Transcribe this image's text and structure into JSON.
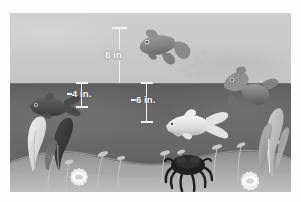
{
  "figure": {
    "kind": "aquarium-depth-diagram",
    "frame": {
      "x": 10,
      "y": 13,
      "width": 281,
      "height": 179
    },
    "background_color": "#ffffff"
  },
  "scene": {
    "air": {
      "label": "air-above-water",
      "color": "#c9c9c9",
      "top": 0,
      "height": 70
    },
    "water": {
      "label": "water",
      "color": "#656565",
      "top": 70,
      "height": 109
    },
    "waterline": {
      "label": "water-surface",
      "y": 70,
      "color": "#ebebeb"
    },
    "floor": {
      "label": "sand-bottom",
      "color": "#9a9a9a",
      "top": 128,
      "height": 51
    }
  },
  "measurements": [
    {
      "id": "height-above-water",
      "value": "8 in.",
      "number": 8,
      "unit": "in.",
      "orientation": "vertical",
      "from": "top-of-tank",
      "to": "water-surface",
      "x": 118,
      "top": 14,
      "length": 56,
      "label_offset": 26
    },
    {
      "id": "depth-left",
      "value": "4 in.",
      "number": 4,
      "unit": "in.",
      "orientation": "vertical",
      "from": "water-surface",
      "to": "fish-depth-left",
      "x": 81,
      "top": 70,
      "length": 24,
      "label_offset": 8
    },
    {
      "id": "depth-center",
      "value": "6 in.",
      "number": 6,
      "unit": "in.",
      "orientation": "vertical",
      "from": "water-surface",
      "to": "fish-depth-center",
      "x": 146,
      "top": 70,
      "length": 39,
      "label_offset": 10
    }
  ],
  "objects": {
    "fish": [
      {
        "id": "goldfish-surface",
        "name": "fish-near-surface",
        "tone": "#8e8e8e"
      },
      {
        "id": "fish-breaching",
        "name": "fish-breaking-surface",
        "tone": "#8a8a8a"
      },
      {
        "id": "fish-dark-left",
        "name": "dark-fish-left",
        "tone": "#4f4f4f"
      },
      {
        "id": "fish-white-center",
        "name": "white-fish-center",
        "tone": "#e6e6e6"
      }
    ],
    "creature": {
      "id": "crab",
      "name": "crab-on-sand",
      "tone": "#2a2a2a"
    },
    "plants": [
      {
        "id": "leaf-light-left",
        "name": "light-leaf-plant-left",
        "tone": "#dcdcdc"
      },
      {
        "id": "leaf-dark-left",
        "name": "dark-leaf-plant-left",
        "tone": "#3c3c3c"
      },
      {
        "id": "kelp-right",
        "name": "kelp-plant-right",
        "tone": "#b9b9b9"
      }
    ],
    "anemones": [
      {
        "id": "anemone-left",
        "name": "anemone-flower-left",
        "tone": "#ededed"
      },
      {
        "id": "anemone-right",
        "name": "anemone-flower-right",
        "tone": "#f0f0f0"
      }
    ],
    "bubbles": {
      "id": "bubbles",
      "name": "bubble-cluster",
      "count": 7,
      "tone": "#bdbdbd"
    },
    "grasses": {
      "id": "grasses",
      "name": "sea-grass-sprouts",
      "count": 6,
      "tone": "#c2c2c2"
    }
  }
}
